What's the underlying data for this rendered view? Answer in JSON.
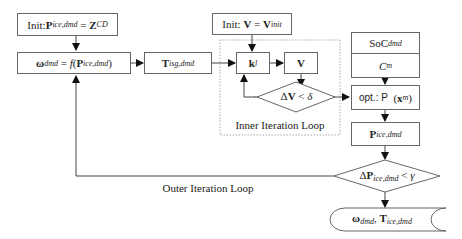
{
  "diagram": {
    "nodes": {
      "init_p": {
        "prefix": "Init: ",
        "var": "P",
        "sub": "ice,dmd",
        "eq": " = ",
        "val": "Z",
        "val_sub": "CD"
      },
      "omega": {
        "var": "ω",
        "sub": "dmd",
        "eq": " = ",
        "func": "f",
        "open": "(",
        "arg": "P",
        "arg_sub": "ice,dmd",
        "close": ")"
      },
      "t_isg": {
        "var": "T",
        "sub": "isg,dmd"
      },
      "init_v": {
        "prefix": "Init: ",
        "var": "V",
        "eq": " = ",
        "val": "V",
        "val_sub": "init"
      },
      "k_l": {
        "var": "k",
        "sub": "l"
      },
      "v": {
        "var": "V"
      },
      "dv_check": {
        "delta": "Δ",
        "var": "V",
        "op": " < ",
        "thr": "δ"
      },
      "soc": {
        "var": "SoC",
        "sub": "dmd"
      },
      "cm": {
        "var": "C",
        "sub": "m"
      },
      "opt": {
        "prefix": "opt.: ",
        "func": "P",
        "open": "  (",
        "arg": "x",
        "arg_sub": "m",
        "close": ")"
      },
      "p_ice": {
        "var": "P",
        "sub": "ice,dmd"
      },
      "dp_check": {
        "delta": "Δ",
        "var": "P",
        "sub": "ice,dmd",
        "op": " < ",
        "thr": "γ"
      },
      "output": {
        "var1": "ω",
        "sub1": "dmd",
        "sep": ", ",
        "var2": "T",
        "sub2": "ice,dmd"
      }
    },
    "labels": {
      "inner_loop": "Inner Iteration Loop",
      "outer_loop": "Outer Iteration Loop"
    },
    "colors": {
      "stroke": "#666666",
      "arrow": "#111111",
      "dotted": "#aaaaaa"
    }
  }
}
